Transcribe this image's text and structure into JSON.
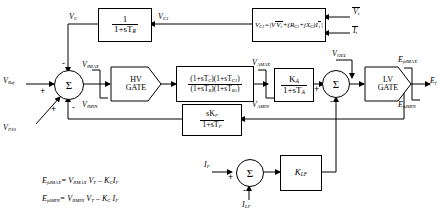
{
  "diagram": {
    "blocks": {
      "transducer": {
        "name": "transducer-block",
        "num": "1",
        "den": "1+sT",
        "den_sub": "R"
      },
      "compensator": {
        "name": "compensator-equation-block",
        "text": "V",
        "sub": "C1",
        "eq": "=|V",
        "eq2": "+(R",
        "eq3": "+jX",
        "eq4": ")I",
        "full": "VC1=|Vt+(RC+jXC)It|"
      },
      "leadlag": {
        "num": "(1+sT",
        "num_s1": "C",
        "num_m": ")(1+sT",
        "num_s2": "C1",
        "num_e": ")",
        "den": "(1+sT",
        "den_s1": "B",
        "den_m": ")(1+sT",
        "den_s2": "B1",
        "den_e": ")"
      },
      "regulator": {
        "num": "K",
        "num_sub": "A",
        "den": "1+sT",
        "den_sub": "A"
      },
      "washout": {
        "num": "sK",
        "num_sub": "F",
        "den": "1+sT",
        "den_sub": "F"
      },
      "klf": {
        "text": "K",
        "sub": "LF"
      },
      "hv_gate": {
        "line1": "HV",
        "line2": "GATE"
      },
      "lv_gate": {
        "line1": "LV",
        "line2": "GATE"
      }
    },
    "summers": {
      "main": "Σ",
      "second": "Σ",
      "current": "Σ"
    },
    "signals": {
      "vc": "V",
      "vc_sub": "C",
      "vc1": "V",
      "vc1_sub": "C1",
      "vt_bar": "V",
      "vt_bar_sub": "t",
      "it_bar": "I",
      "it_bar_sub": "t",
      "vref": "V",
      "vref_sub": "Ref",
      "vpss": "V",
      "vpss_sub": "PSS",
      "vimax": "V",
      "vimax_sub": "IMAX",
      "vimin": "V",
      "vimin_sub": "IMIN",
      "vamax": "V",
      "vamax_sub": "AMAX",
      "vamin": "V",
      "vamin_sub": "AMIN",
      "voel": "V",
      "voel_sub": "OEL",
      "efdmax": "E",
      "efdmax_sub": "fdMAX",
      "efdmin": "E",
      "efdmin_sub": "fdMIN",
      "ef": "E",
      "ef_sub": "f",
      "if": "I",
      "if_sub": "F",
      "ilf": "I",
      "ilf_sub": "LF"
    },
    "signs": {
      "plus": "+",
      "minus": "-"
    },
    "equations": [
      {
        "name": "efdmax-equation",
        "lhs": "E",
        "lhs_sub": "fdMAX",
        "rhs": "= V",
        "rhs_sub1": "RMAX",
        "rhs2": " V",
        "rhs_sub2": "T",
        "rhs3": " – K",
        "rhs_sub3": "C",
        "rhs4": "I",
        "rhs_sub4": "F"
      },
      {
        "name": "efdmin-equation",
        "lhs": "E",
        "lhs_sub": "fdMIN",
        "rhs": "= V",
        "rhs_sub1": "RMIN",
        "rhs2": " V",
        "rhs_sub2": "T",
        "rhs3": " – K",
        "rhs_sub3": "C",
        "rhs4": " I",
        "rhs_sub4": "F"
      }
    ],
    "colors": {
      "ink": "#000000",
      "paper": "#ffffff"
    }
  }
}
